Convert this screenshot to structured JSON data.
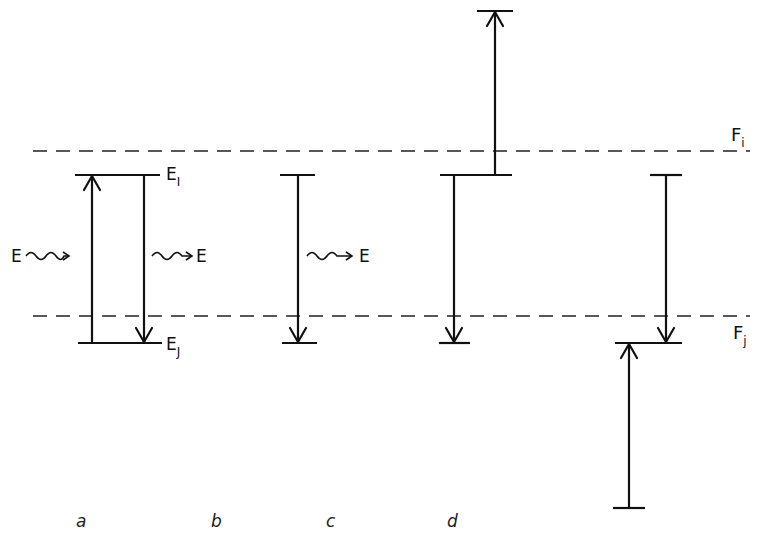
{
  "figure": {
    "levels": {
      "upper_dashed_label": "F",
      "upper_dashed_sub": "i",
      "lower_dashed_label": "F",
      "lower_dashed_sub": "j"
    },
    "panel_a": {
      "label": "a",
      "upper_level": "E",
      "upper_level_sub": "I",
      "lower_level": "E",
      "lower_level_sub": "J",
      "incoming_photon": "E",
      "outgoing_photon": "E"
    },
    "panel_b": {
      "label": "b",
      "outgoing_photon": "E"
    },
    "panel_c": {
      "label": "c"
    },
    "panel_d": {
      "label": "d"
    }
  }
}
